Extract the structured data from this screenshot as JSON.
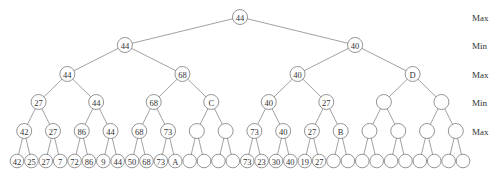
{
  "diagram": {
    "type": "minimax-game-tree",
    "branching": 2,
    "depth": 5,
    "level_labels": [
      "Max",
      "Min",
      "Max",
      "Min",
      "Max"
    ],
    "levels": [
      [
        "44"
      ],
      [
        "44",
        "40"
      ],
      [
        "44",
        "68",
        "40",
        "D"
      ],
      [
        "27",
        "44",
        "68",
        "C",
        "40",
        "27",
        "",
        ""
      ],
      [
        "42",
        "27",
        "86",
        "44",
        "68",
        "73",
        "",
        "",
        "73",
        "40",
        "27",
        "B",
        "",
        "",
        "",
        ""
      ],
      [
        "42",
        "25",
        "27",
        "7",
        "72",
        "86",
        "9",
        "44",
        "50",
        "68",
        "73",
        "A",
        "",
        "",
        "",
        "",
        "73",
        "23",
        "30",
        "40",
        "19",
        "27",
        "",
        "",
        "",
        "",
        "",
        "",
        "",
        "",
        "",
        ""
      ]
    ]
  }
}
